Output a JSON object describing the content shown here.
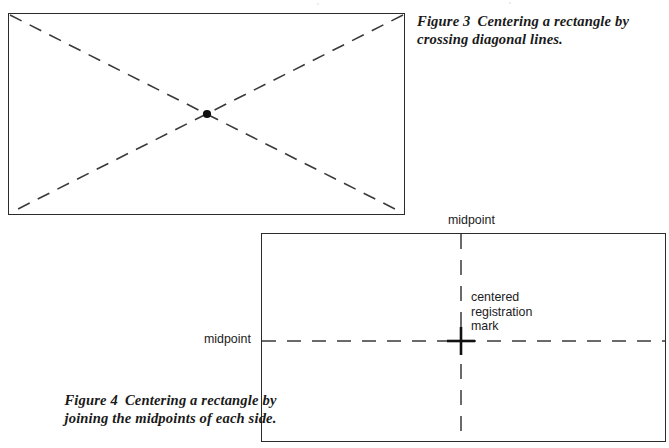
{
  "page": {
    "width": 669,
    "height": 448,
    "background_color": "#ffffff",
    "ink_color": "#2b2b2b"
  },
  "figures": [
    {
      "id": "figure-3",
      "name": "crossing-diagonals",
      "caption_label": "Figure 3",
      "caption_text": "Centering a rectangle by crossing diagonal lines.",
      "caption_full": "Figure 3  Centering a rectangle by crossing diagonal lines.",
      "shape": "rectangle",
      "construction": "two dashed diagonal lines drawn corner to corner",
      "rect": {
        "x": 8,
        "y": 13,
        "width": 397,
        "height": 202
      },
      "center_point": {
        "x": 199,
        "y": 101,
        "label": "center dot"
      },
      "dash_pattern": "13 9",
      "line_color": "#3a3a3a",
      "annotations": []
    },
    {
      "id": "figure-4",
      "name": "joining-midpoints",
      "caption_label": "Figure 4",
      "caption_text": "Centering a rectangle by joining the midpoints of each side.",
      "caption_full": "Figure 4  Centering a rectangle by joining the midpoints of each side.",
      "shape": "rectangle",
      "construction": "dashed vertical and horizontal lines joining opposite side midpoints",
      "rect": {
        "x": 261,
        "y": 233,
        "width": 405,
        "height": 209
      },
      "center_point": {
        "x": 200,
        "y": 108,
        "label": "centered registration mark"
      },
      "dash_pattern_horizontal": "14 11",
      "dash_pattern_vertical": "15 11",
      "line_color": "#3a3a3a",
      "annotations": [
        {
          "name": "midpoint-top",
          "text": "midpoint"
        },
        {
          "name": "midpoint-left",
          "text": "midpoint"
        },
        {
          "name": "registration-mark",
          "text": "centered\nregistration\nmark"
        }
      ]
    }
  ],
  "labels": {
    "midpoint_top": "midpoint",
    "midpoint_left": "midpoint",
    "registration_mark": "centered\nregistration\nmark"
  },
  "captions": {
    "figure3_label": "Figure 3",
    "figure3_body": "Centering a rectangle by crossing diagonal lines.",
    "figure4_label": "Figure 4",
    "figure4_body": "Centering a rectangle by joining the midpoints of each side."
  }
}
